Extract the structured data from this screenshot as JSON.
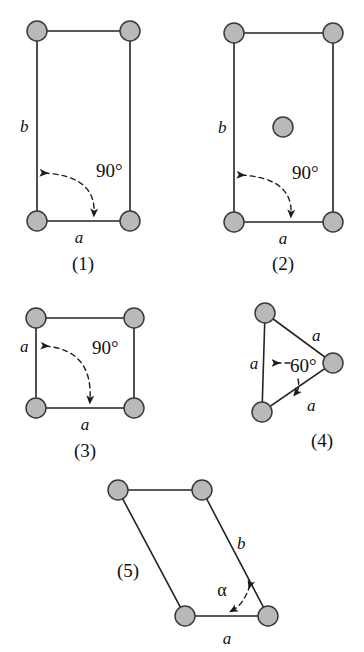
{
  "figure": {
    "background_color": "#ffffff",
    "node_fill_color": "#b9b9b9",
    "node_stroke_color": "#3a3a3a",
    "edge_color": "#242424"
  },
  "diagrams": [
    {
      "id": "1",
      "caption": "(1)",
      "shape": "rectangle",
      "labels": {
        "side_vertical": "b",
        "side_horizontal": "a",
        "angle": "90°"
      }
    },
    {
      "id": "2",
      "caption": "(2)",
      "shape": "centered-rectangle",
      "labels": {
        "side_vertical": "b",
        "side_horizontal": "a",
        "angle": "90°"
      }
    },
    {
      "id": "3",
      "caption": "(3)",
      "shape": "square",
      "labels": {
        "side_vertical": "a",
        "side_horizontal": "a",
        "angle": "90°"
      }
    },
    {
      "id": "4",
      "caption": "(4)",
      "shape": "triangle",
      "labels": {
        "side_left": "a",
        "side_upper_right": "a",
        "side_lower_right": "a",
        "angle": "60°"
      }
    },
    {
      "id": "5",
      "caption": "(5)",
      "shape": "parallelogram",
      "labels": {
        "side_slanted": "b",
        "side_horizontal": "a",
        "angle": "α"
      }
    }
  ]
}
